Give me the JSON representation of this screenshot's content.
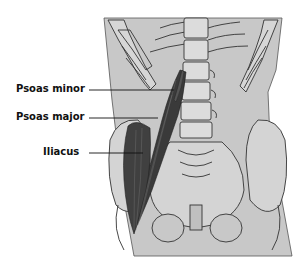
{
  "figure": {
    "colors": {
      "background": "#ffffff",
      "body_fill": "#c8c8c8",
      "bone_fill": "#d9d9d9",
      "outline": "#333333",
      "muscle": "#3a3a3a",
      "label_text": "#111111"
    }
  },
  "labels": [
    {
      "id": "psoas-minor",
      "text": "Psoas minor"
    },
    {
      "id": "psoas-major",
      "text": "Psoas major"
    },
    {
      "id": "iliacus",
      "text": "Iliacus"
    }
  ]
}
